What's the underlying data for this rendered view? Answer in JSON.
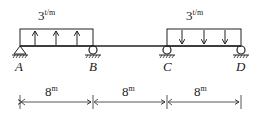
{
  "diagram": {
    "type": "continuous-beam",
    "loads": [
      {
        "span": "A-B",
        "magnitude": "3",
        "unit": "t/m",
        "direction": "up"
      },
      {
        "span": "C-D",
        "magnitude": "3",
        "unit": "t/m",
        "direction": "down"
      }
    ],
    "supports": [
      {
        "label": "A",
        "type": "pin"
      },
      {
        "label": "B",
        "type": "roller"
      },
      {
        "label": "C",
        "type": "roller"
      },
      {
        "label": "D",
        "type": "roller"
      }
    ],
    "dimensions": [
      {
        "value": "8",
        "unit": "m"
      },
      {
        "value": "8",
        "unit": "m"
      },
      {
        "value": "8",
        "unit": "m"
      }
    ]
  }
}
